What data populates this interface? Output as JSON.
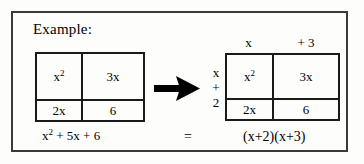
{
  "heading": {
    "label": "Example:"
  },
  "colors": {
    "frame_border": "#3a3a3a",
    "grid_border": "#1a1a1a",
    "ink": "#000000",
    "background": "#fdfdfc"
  },
  "left_model": {
    "name": "area-model-expanded",
    "cells": [
      {
        "value_base": "x",
        "value_exp": "2",
        "text": "x²"
      },
      {
        "value_base": "3x",
        "value_exp": "",
        "text": "3x"
      },
      {
        "value_base": "2x",
        "value_exp": "",
        "text": "2x"
      },
      {
        "value_base": "6",
        "value_exp": "",
        "text": "6"
      }
    ],
    "caption_base": "x",
    "caption_exp": "2",
    "caption_rest": " + 5x + 6",
    "caption_full": "x² + 5x + 6"
  },
  "arrow": {
    "icon": "arrow-right-icon",
    "direction": "right"
  },
  "right_model": {
    "name": "area-model-factored",
    "cells": [
      {
        "value_base": "x",
        "value_exp": "2",
        "text": "x²"
      },
      {
        "value_base": "3x",
        "value_exp": "",
        "text": "3x"
      },
      {
        "value_base": "2x",
        "value_exp": "",
        "text": "2x"
      },
      {
        "value_base": "6",
        "value_exp": "",
        "text": "6"
      }
    ],
    "top_factors": [
      "x",
      "+ 3"
    ],
    "left_factors": [
      "x",
      "+",
      "2"
    ],
    "caption_full": "(x+2)(x+3)"
  },
  "relation": {
    "equals": "="
  }
}
